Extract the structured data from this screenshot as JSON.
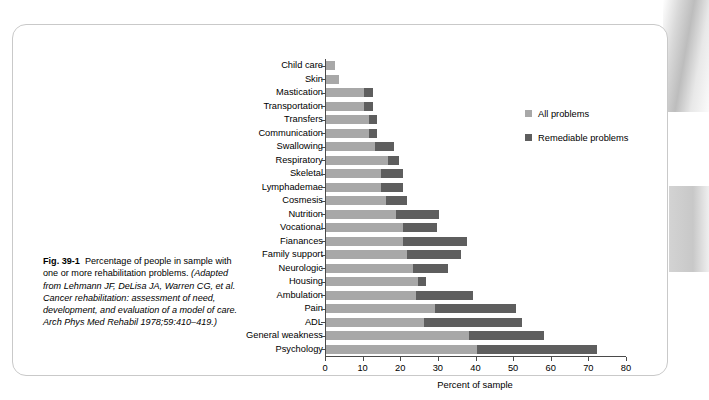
{
  "caption": {
    "fig_number": "Fig. 39-1",
    "lead": "Percentage of people in sample with one or more rehabilitation problems.",
    "source": "(Adapted from Lehmann JF, DeLisa JA, Warren CG, et al. Cancer rehabilitation: assessment of need, development, and evaluation of a model of care. Arch Phys Med Rehabil 1978;59:410–419.)"
  },
  "legend": {
    "position": "top-right",
    "entries": [
      {
        "label": "All problems",
        "color": "#a8a8a8"
      },
      {
        "label": "Remediable problems",
        "color": "#5e5e5e"
      }
    ]
  },
  "chart_data": {
    "type": "bar",
    "orientation": "horizontal",
    "title": "",
    "xlabel": "Percent of sample",
    "ylabel": "",
    "xlim": [
      0,
      80
    ],
    "xticks": [
      0,
      10,
      20,
      30,
      40,
      50,
      60,
      70,
      80
    ],
    "grid": false,
    "stacked": false,
    "note": "Each category shows one bar: a light segment (All problems) with a darker overlay segment ending at the Remediable problems value.",
    "categories": [
      "Child care",
      "Skin",
      "Mastication",
      "Transportation",
      "Transfers",
      "Communication",
      "Swallowing",
      "Respiratory",
      "Skeletal",
      "Lymphademae",
      "Cosmesis",
      "Nutrition",
      "Vocational",
      "Fianances",
      "Family support",
      "Neurologic",
      "Housing",
      "Ambulation",
      "Pain",
      "ADL",
      "General weakness",
      "Psychology"
    ],
    "category_labels": [
      "Child care",
      "Skin",
      "Mastication",
      "Transportation",
      "Transfers",
      "Communication",
      "Swallowing",
      "Respiratory",
      "Skeletal",
      "Lymphademae",
      "Cosmesis",
      "Nutrition",
      "Vocational",
      "Fianances",
      "Family support",
      "Neurologic",
      "Housing",
      "Ambulation",
      "Pain",
      "ADL",
      "General weakness",
      "Psychology"
    ],
    "series": [
      {
        "name": "All problems",
        "color": "#a8a8a8",
        "values": [
          2.5,
          3.5,
          10.0,
          10.0,
          11.5,
          11.5,
          13.0,
          16.5,
          14.5,
          14.5,
          16.0,
          18.5,
          20.5,
          20.5,
          21.5,
          23.0,
          24.5,
          24.0,
          29.0,
          26.0,
          38.0,
          40.0
        ]
      },
      {
        "name": "Remediable problems",
        "color": "#5e5e5e",
        "values": [
          2.5,
          3.5,
          12.5,
          12.5,
          13.5,
          13.5,
          18.0,
          19.5,
          20.5,
          20.5,
          21.5,
          30.0,
          29.5,
          37.5,
          36.0,
          32.5,
          26.5,
          39.0,
          50.5,
          52.0,
          58.0,
          72.0
        ]
      }
    ]
  }
}
